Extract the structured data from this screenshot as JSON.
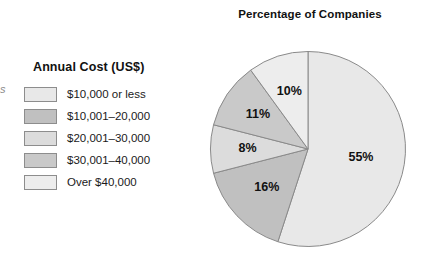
{
  "edge_fragment": "s",
  "legend": {
    "title": "Annual Cost (US$)",
    "items": [
      {
        "label": "$10,000 or less",
        "color": "#e8e8e8"
      },
      {
        "label": "$10,001–20,000",
        "color": "#c0c0c0"
      },
      {
        "label": "$20,001–30,000",
        "color": "#dcdcdc"
      },
      {
        "label": "$30,001–40,000",
        "color": "#c9c9c9"
      },
      {
        "label": "Over $40,000",
        "color": "#ededed"
      }
    ]
  },
  "chart_data": {
    "type": "pie",
    "title": "Percentage of Companies",
    "categories": [
      "$10,000 or less",
      "$10,001–20,000",
      "$20,001–30,000",
      "$30,001–40,000",
      "Over $40,000"
    ],
    "values": [
      55,
      16,
      8,
      11,
      10
    ],
    "data_labels": [
      "55%",
      "16%",
      "8%",
      "11%",
      "10%"
    ],
    "colors": [
      "#e8e8e8",
      "#c0c0c0",
      "#dcdcdc",
      "#c9c9c9",
      "#ededed"
    ],
    "units": "percent",
    "total": 100,
    "start_angle_deg": 0,
    "direction": "clockwise",
    "legend_position": "left",
    "grid": false,
    "xlabel": "",
    "ylabel": ""
  }
}
